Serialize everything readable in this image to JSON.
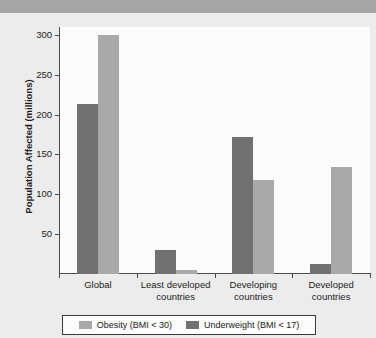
{
  "header": {
    "title": ""
  },
  "legend": {
    "position": "bottom",
    "items": [
      {
        "label": "Obesity (BMI < 30)",
        "color": "#a9a9a9",
        "key": "obesity"
      },
      {
        "label": "Underweight (BMI < 17)",
        "color": "#717171",
        "key": "underweight"
      }
    ]
  },
  "axis": {
    "y_label": "Population Affected (millions)",
    "y_ticks": [
      50,
      100,
      150,
      200,
      250,
      300
    ],
    "y_min": 0,
    "y_max": 310
  },
  "chart_data": {
    "type": "bar",
    "title": "",
    "xlabel": "",
    "ylabel": "Population Affected (millions)",
    "ylim": [
      0,
      310
    ],
    "yticks": [
      50,
      100,
      150,
      200,
      250,
      300
    ],
    "grid": false,
    "legend_position": "bottom",
    "categories": [
      "Global",
      "Least developed countries",
      "Developing countries",
      "Developed countries"
    ],
    "series": [
      {
        "name": "Underweight (BMI < 17)",
        "color": "#717171",
        "values": [
          214,
          30,
          172,
          13
        ]
      },
      {
        "name": "Obesity (BMI < 30)",
        "color": "#a9a9a9",
        "values": [
          300,
          5,
          118,
          134
        ]
      }
    ],
    "series_order_in_group": [
      "Underweight (BMI < 17)",
      "Obesity (BMI < 30)"
    ]
  },
  "colors": {
    "page_background": "#e9e9e9",
    "plot_background": "#fbfbfb",
    "header_band": "#a6a6a6",
    "axis": "#4a4a4a",
    "text": "#1c1c1c"
  }
}
